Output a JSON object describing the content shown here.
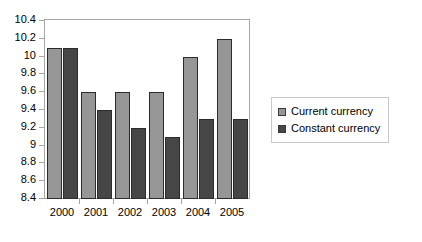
{
  "chart_data": {
    "type": "bar",
    "title": "",
    "xlabel": "",
    "ylabel": "",
    "categories": [
      "2000",
      "2001",
      "2002",
      "2003",
      "2004",
      "2005"
    ],
    "series": [
      {
        "name": "Current currency",
        "color": "#969696",
        "values": [
          10.1,
          9.6,
          9.6,
          9.6,
          10.0,
          10.2
        ]
      },
      {
        "name": "Constant currency",
        "color": "#464646",
        "values": [
          10.1,
          9.4,
          9.2,
          9.1,
          9.3,
          9.3
        ]
      }
    ],
    "ylim": [
      8.4,
      10.4
    ],
    "ytick_step": 0.2,
    "yticks": [
      "10.4",
      "10.2",
      "10",
      "9.8",
      "9.6",
      "9.4",
      "9.2",
      "9",
      "8.8",
      "8.6",
      "8.4"
    ],
    "grid": false,
    "legend_position": "right",
    "plot_border_color": "#a6a6a6",
    "bar_border_color": "#2b2b2b",
    "background_color": "#ffffff"
  }
}
